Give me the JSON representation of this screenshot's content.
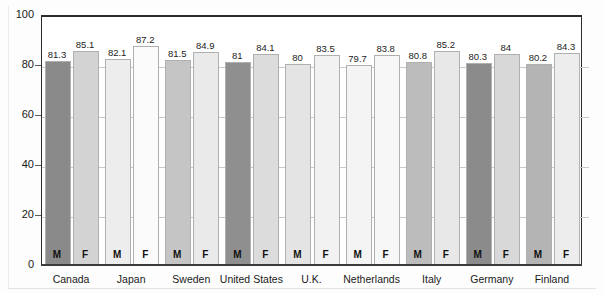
{
  "chart_data": {
    "type": "bar",
    "title": "",
    "subtitle": "",
    "xlabel": "",
    "ylabel": "",
    "ylim": [
      0,
      100
    ],
    "yticks": [
      0,
      20,
      40,
      60,
      80,
      100
    ],
    "grid": false,
    "legend_position": "none",
    "categories": [
      "Canada",
      "Japan",
      "Sweden",
      "United States",
      "U.K.",
      "Netherlands",
      "Italy",
      "Germany",
      "Finland"
    ],
    "series": [
      {
        "name": "M",
        "values": [
          81.3,
          82.1,
          81.5,
          81,
          80,
          79.7,
          80.8,
          80.3,
          80.2
        ]
      },
      {
        "name": "F",
        "values": [
          85.1,
          87.2,
          84.9,
          84.1,
          83.5,
          83.8,
          85.2,
          84,
          84.3
        ]
      }
    ],
    "bar_colors_m": [
      "#8a8a8a",
      "#ededed",
      "#c5c5c5",
      "#8f8f8f",
      "#e4e4e4",
      "#f4f4f4",
      "#bcbcbc",
      "#8b8b8b",
      "#b4b4b4"
    ],
    "bar_colors_f": [
      "#d3d3d3",
      "#fbfbfb",
      "#eaeaea",
      "#dcdcdc",
      "#f2f2f2",
      "#f7f7f7",
      "#e8e8e8",
      "#d8d8d8",
      "#ededed"
    ],
    "value_labels": [
      [
        "81.3",
        "85.1"
      ],
      [
        "82.1",
        "87.2"
      ],
      [
        "81.5",
        "84.9"
      ],
      [
        "81",
        "84.1"
      ],
      [
        "80",
        "83.5"
      ],
      [
        "79.7",
        "83.8"
      ],
      [
        "80.8",
        "85.2"
      ],
      [
        "80.3",
        "84"
      ],
      [
        "80.2",
        "84.3"
      ]
    ]
  },
  "axis": {
    "y_tick_labels": [
      "0",
      "20",
      "40",
      "60",
      "80",
      "100"
    ]
  },
  "series_marks": {
    "male": "M",
    "female": "F"
  }
}
